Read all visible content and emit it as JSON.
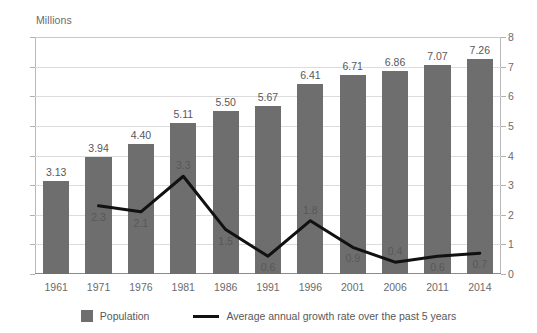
{
  "chart_data": {
    "type": "bar",
    "title": "",
    "subtitle": "",
    "xlabel": "",
    "ylabel": "Millions",
    "categories": [
      "1961",
      "1971",
      "1976",
      "1981",
      "1986",
      "1991",
      "1996",
      "2001",
      "2006",
      "2011",
      "2014"
    ],
    "ylim": [
      0,
      8
    ],
    "y_ticks": [
      "0",
      "1",
      "2",
      "3",
      "4",
      "5",
      "6",
      "7",
      "8"
    ],
    "right_axis": true,
    "right_ylim": [
      0,
      8
    ],
    "right_y_ticks": [
      "0",
      "1",
      "2",
      "3",
      "4",
      "5",
      "6",
      "7",
      "8"
    ],
    "grid": true,
    "legend_position": "bottom",
    "series": [
      {
        "name": "Population",
        "type": "bar",
        "color": "#6e6e6e",
        "values": [
          3.13,
          3.94,
          4.4,
          5.11,
          5.5,
          5.67,
          6.41,
          6.71,
          6.86,
          7.07,
          7.26
        ],
        "labels": [
          "3.13",
          "3.94",
          "4.40",
          "5.11",
          "5.50",
          "5.67",
          "6.41",
          "6.71",
          "6.86",
          "7.07",
          "7.26"
        ]
      },
      {
        "name": "Average annual growth rate over the past 5 years",
        "type": "line",
        "color": "#111111",
        "values": [
          null,
          2.3,
          2.1,
          3.3,
          1.5,
          0.6,
          1.8,
          0.9,
          0.4,
          0.6,
          0.7
        ],
        "labels": [
          "",
          "2.3",
          "2.1",
          "3.3",
          "1.5",
          "0.6",
          "1.8",
          "0.9",
          "0.4",
          "0.6",
          "0.7"
        ],
        "label_placement": [
          "",
          "below",
          "below",
          "above",
          "below",
          "below",
          "above",
          "below",
          "above",
          "below",
          "below"
        ]
      }
    ]
  },
  "legend": {
    "items": [
      {
        "label": "Population",
        "marker": "square",
        "color": "#6e6e6e"
      },
      {
        "label": "Average annual growth rate over the past 5 years",
        "marker": "line",
        "color": "#111111"
      }
    ]
  },
  "colors": {
    "bar": "#6e6e6e",
    "line": "#111111",
    "grid": "#dcdcdd",
    "axis": "#b8b8ba",
    "text": "#58585a",
    "tick_text": "#6b6b6d",
    "background": "#ffffff"
  }
}
